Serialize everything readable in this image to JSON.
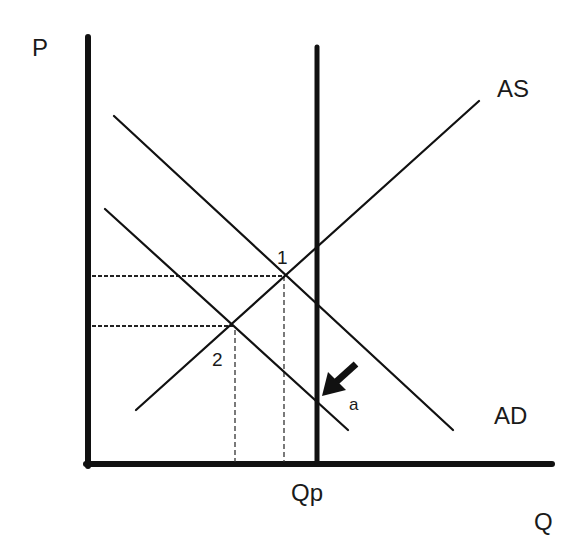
{
  "diagram": {
    "type": "AS-AD economic diagram",
    "axes": {
      "y_label": "P",
      "x_label": "Q"
    },
    "curves": {
      "as_label": "AS",
      "ad_label": "AD"
    },
    "vertical_line_label": "Qp",
    "points": {
      "p1_label": "1",
      "p2_label": "2",
      "a_label": "a"
    },
    "colors": {
      "ink": "#111111",
      "background": "#ffffff"
    }
  }
}
